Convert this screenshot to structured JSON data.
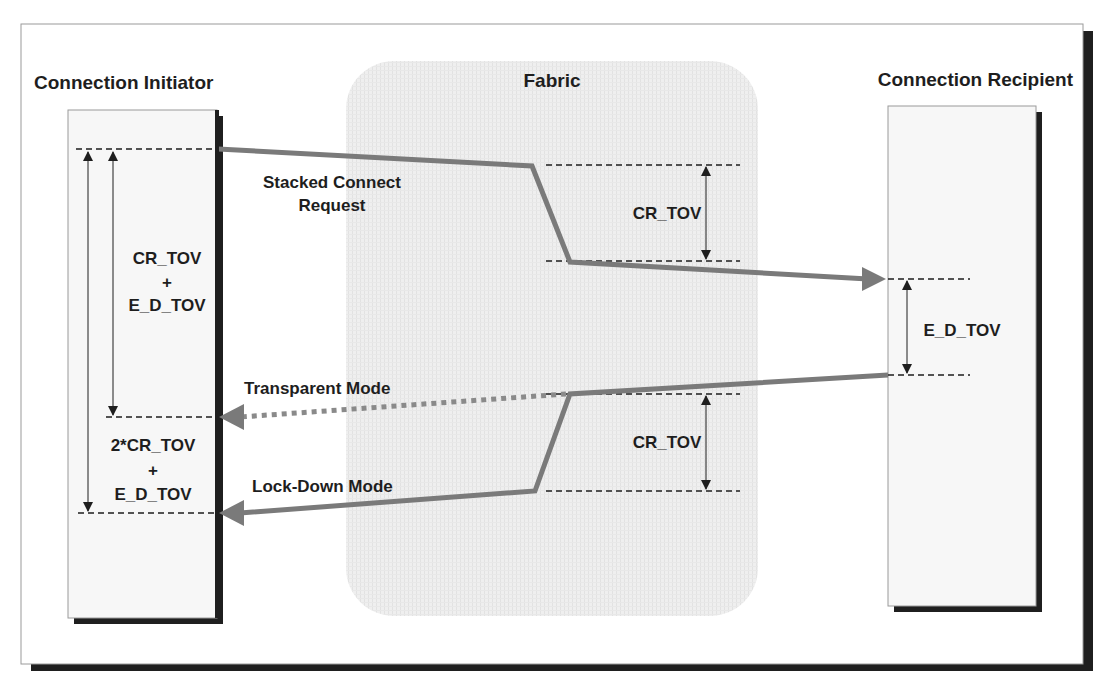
{
  "diagram": {
    "colors": {
      "frame_border": "#9a9a9a",
      "shadow": "#1f1f1f",
      "fabric_fill": "#ececec",
      "node_fill": "#f7f7f7",
      "arrow": "#7a7a7a",
      "dash": "#1e1e1e",
      "text": "#1e1e1e"
    },
    "titles": {
      "initiator": "Connection  Initiator",
      "fabric": "Fabric",
      "recipient": "Connection Recipient"
    },
    "labels": {
      "stacked_line1": "Stacked Connect",
      "stacked_line2": "Request",
      "transparent": "Transparent Mode",
      "lockdown": "Lock-Down Mode",
      "fabric_cr_tov_top": "CR_TOV",
      "fabric_cr_tov_bottom": "CR_TOV",
      "recipient_ed_tov": "E_D_TOV",
      "initiator_interval1_line1": "CR_TOV",
      "initiator_interval1_line2": "+",
      "initiator_interval1_line3": "E_D_TOV",
      "initiator_interval2_line1": "2*CR_TOV",
      "initiator_interval2_line2": "+",
      "initiator_interval2_line3": "E_D_TOV"
    }
  }
}
